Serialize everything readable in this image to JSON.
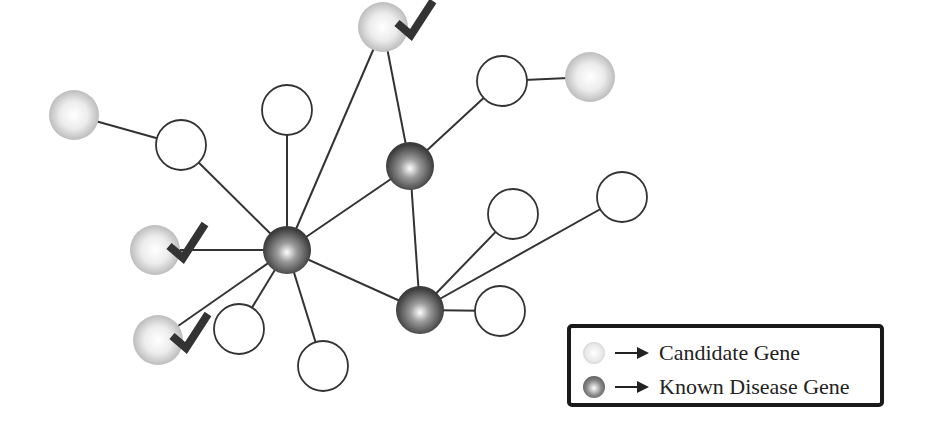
{
  "diagram": {
    "type": "gene-network",
    "colors": {
      "edge": "#333333",
      "candidate_fill": "#e6e6e6",
      "known_fill": "#555555",
      "plain_stroke": "#333333",
      "check": "#333333"
    },
    "nodes": [
      {
        "id": "n1",
        "kind": "candidate",
        "x": 74,
        "y": 115,
        "r": 25
      },
      {
        "id": "n2",
        "kind": "plain",
        "x": 181,
        "y": 145,
        "r": 25
      },
      {
        "id": "n3",
        "kind": "plain",
        "x": 287,
        "y": 110,
        "r": 25
      },
      {
        "id": "n4",
        "kind": "candidate",
        "x": 383,
        "y": 27,
        "r": 25,
        "checked": true
      },
      {
        "id": "n5",
        "kind": "plain",
        "x": 502,
        "y": 81,
        "r": 25
      },
      {
        "id": "n6",
        "kind": "candidate",
        "x": 590,
        "y": 77,
        "r": 25
      },
      {
        "id": "n7",
        "kind": "known",
        "x": 410,
        "y": 166,
        "r": 24
      },
      {
        "id": "n8",
        "kind": "candidate",
        "x": 155,
        "y": 250,
        "r": 25,
        "checked": true
      },
      {
        "id": "n9",
        "kind": "known",
        "x": 287,
        "y": 250,
        "r": 24
      },
      {
        "id": "n10",
        "kind": "plain",
        "x": 513,
        "y": 214,
        "r": 25
      },
      {
        "id": "n11",
        "kind": "plain",
        "x": 622,
        "y": 197,
        "r": 25
      },
      {
        "id": "n12",
        "kind": "candidate",
        "x": 158,
        "y": 340,
        "r": 25,
        "checked": true
      },
      {
        "id": "n13",
        "kind": "plain",
        "x": 239,
        "y": 329,
        "r": 25
      },
      {
        "id": "n14",
        "kind": "plain",
        "x": 323,
        "y": 366,
        "r": 25
      },
      {
        "id": "n15",
        "kind": "known",
        "x": 420,
        "y": 310,
        "r": 24
      },
      {
        "id": "n16",
        "kind": "plain",
        "x": 500,
        "y": 311,
        "r": 25
      }
    ],
    "edges": [
      [
        "n1",
        "n2"
      ],
      [
        "n2",
        "n9"
      ],
      [
        "n3",
        "n9"
      ],
      [
        "n4",
        "n9"
      ],
      [
        "n4",
        "n7"
      ],
      [
        "n5",
        "n6"
      ],
      [
        "n5",
        "n7"
      ],
      [
        "n7",
        "n9"
      ],
      [
        "n7",
        "n15"
      ],
      [
        "n8",
        "n9"
      ],
      [
        "n12",
        "n9"
      ],
      [
        "n13",
        "n9"
      ],
      [
        "n14",
        "n9"
      ],
      [
        "n9",
        "n15"
      ],
      [
        "n15",
        "n10"
      ],
      [
        "n15",
        "n11"
      ],
      [
        "n15",
        "n16"
      ]
    ]
  },
  "legend": {
    "items": [
      {
        "kind": "candidate",
        "label": "Candidate Gene"
      },
      {
        "kind": "known",
        "label": "Known Disease Gene"
      }
    ]
  }
}
